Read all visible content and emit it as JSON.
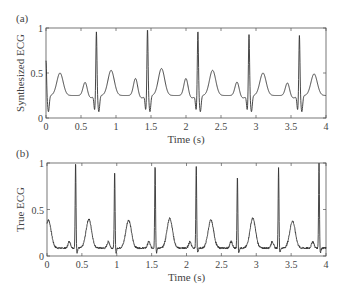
{
  "chart_data": [
    {
      "type": "line",
      "panel_label": "(a)",
      "title": "",
      "xlabel": "Time (s)",
      "ylabel": "Synthesized ECG",
      "xlim": [
        0,
        4
      ],
      "ylim": [
        0,
        1
      ],
      "xticks": [
        "0",
        "0.5",
        "1",
        "1.5",
        "2",
        "2.5",
        "3",
        "3.5",
        "4"
      ],
      "yticks": [
        "0",
        "0.5",
        "1"
      ],
      "grid": false,
      "legend": null,
      "series": [
        {
          "name": "Synthesized ECG",
          "color": "#333333",
          "description": "Periodic synthetic ECG, ~0.72 s beat period; R peaks ~0.95-1.0, Q/S dips ~0.05-0.1, T waves ~0.5-0.55, P waves ~0.4, baseline ~0.25",
          "r_peak_times": [
            0.0,
            0.72,
            1.45,
            2.17,
            2.9,
            3.62
          ],
          "r_peak_values": [
            0.65,
            0.97,
            1.0,
            0.98,
            0.94,
            0.93
          ],
          "t_wave_times": [
            0.2,
            0.93,
            1.65,
            2.38,
            3.1,
            3.83
          ],
          "t_wave_values": [
            0.5,
            0.53,
            0.55,
            0.53,
            0.5,
            0.49
          ],
          "p_wave_times": [
            0.56,
            1.28,
            2.0,
            2.73,
            3.45
          ],
          "p_wave_values": [
            0.41,
            0.45,
            0.45,
            0.41,
            0.4
          ]
        }
      ]
    },
    {
      "type": "line",
      "panel_label": "(b)",
      "title": "",
      "xlabel": "Time (s)",
      "ylabel": "True ECG",
      "xlim": [
        0,
        4
      ],
      "ylim": [
        0,
        1
      ],
      "xticks": [
        "0",
        "0.5",
        "1",
        "1.5",
        "2",
        "2.5",
        "3",
        "3.5",
        "4"
      ],
      "yticks": [
        "0",
        "0.5",
        "1"
      ],
      "grid": false,
      "legend": null,
      "series": [
        {
          "name": "True ECG",
          "color": "#333333",
          "description": "Recorded noisy ECG, ~0.58 s beat period; sharp R peaks ~0.85-1.0, T waves ~0.35-0.4, noisy baseline ~0.08",
          "r_peak_times": [
            0.41,
            0.97,
            1.55,
            2.14,
            2.73,
            3.32,
            3.9
          ],
          "r_peak_values": [
            1.0,
            0.9,
            0.97,
            0.95,
            0.85,
            0.94,
            1.0
          ],
          "t_wave_times": [
            0.02,
            0.6,
            1.17,
            1.76,
            2.35,
            2.95,
            3.52
          ],
          "t_wave_values": [
            0.38,
            0.39,
            0.38,
            0.4,
            0.38,
            0.4,
            0.37
          ]
        }
      ]
    }
  ],
  "panels": {
    "a": {
      "label": "(a)",
      "ylabel": "Synthesized ECG",
      "xlabel": "Time (s)"
    },
    "b": {
      "label": "(b)",
      "ylabel": "True ECG",
      "xlabel": "Time (s)"
    }
  }
}
